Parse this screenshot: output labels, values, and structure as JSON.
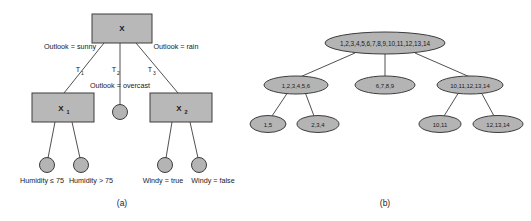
{
  "figure": {
    "corner_mark": "",
    "panels": [
      {
        "id": "panel-a",
        "caption": "(a)",
        "type": "decision-tree-diagram",
        "nodes": {
          "root": "X",
          "left_internal": "X",
          "left_internal_sub": "1",
          "right_internal": "X",
          "right_internal_sub": "2",
          "overcast_leaf": ""
        },
        "edge_labels": {
          "left_branch": "Outlook = sunny",
          "middle_branch": "Outlook = overcast",
          "right_branch": "Outlook = rain"
        },
        "subtree_labels": [
          {
            "base": "T",
            "sub": "1"
          },
          {
            "base": "T",
            "sub": "2"
          },
          {
            "base": "T",
            "sub": "3"
          }
        ],
        "leaf_labels": [
          "Humidity ≤ 75",
          "Humidity > 75",
          "Windy = true",
          "Windy = false"
        ]
      },
      {
        "id": "panel-b",
        "caption": "(b)",
        "type": "instance-partition-tree",
        "nodes": {
          "root": "1,2,3,4,5,6,7,8,9,10,11,12,13,14",
          "level1": [
            "1,2,3,4,5,6",
            "6,7,8,9",
            "10,11,12,13,14"
          ],
          "level2": [
            "1,5",
            "2,3,4",
            "10,11",
            "12,13,14"
          ]
        }
      }
    ]
  },
  "colors": {
    "node_fill": "#b4b4b4",
    "node_stroke": "#3c3c3c",
    "text": "#1a1a1a",
    "background": "#ffffff"
  }
}
